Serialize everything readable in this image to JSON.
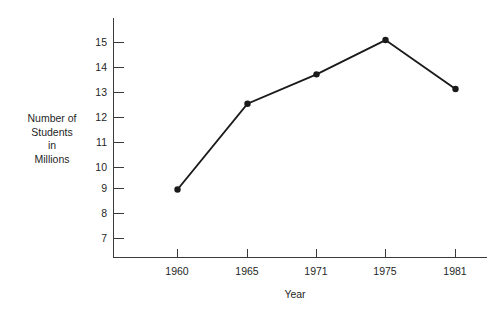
{
  "chart_data": {
    "type": "line",
    "title": "",
    "subtitle": "",
    "xlabel": "Year",
    "ylabel": "Number of Students in Millions",
    "ylabel_lines": [
      "Number of",
      "Students",
      "in",
      "Millions"
    ],
    "categories": [
      "1960",
      "1965",
      "1971",
      "1975",
      "1981"
    ],
    "values": [
      9.0,
      12.5,
      13.7,
      15.1,
      13.1
    ],
    "series": [
      {
        "name": "Number of Students in Millions",
        "values": [
          9.0,
          12.5,
          13.7,
          15.1,
          13.1
        ]
      }
    ],
    "y_tick_labels": [
      "15",
      "14",
      "13",
      "12",
      "11",
      "10",
      "9",
      "8",
      "7"
    ],
    "y_tick_values": [
      15,
      14,
      13,
      12,
      11,
      10,
      9,
      8,
      7
    ],
    "ylim": [
      6.2,
      15.8
    ],
    "grid": false,
    "legend": "none",
    "marker": "circle",
    "line_color": "#1a1a1a",
    "marker_color": "#1a1a1a",
    "axis_color": "#3a3a3a",
    "background_color": "#ffffff",
    "annotations": []
  },
  "axis": {
    "x_title": "Year",
    "y_title_lines": [
      "Number of",
      "Students",
      "in",
      "Millions"
    ]
  }
}
